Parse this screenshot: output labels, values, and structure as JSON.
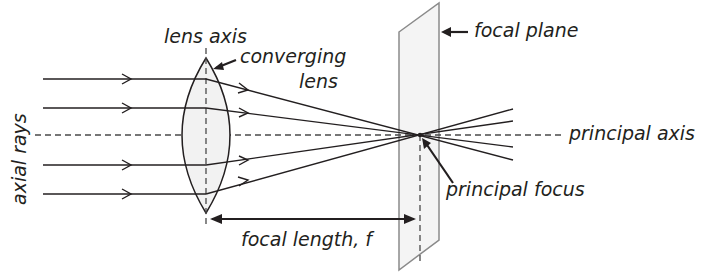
{
  "diagram": {
    "colors": {
      "line": "#231f20",
      "lens_fill": "#f2f2f2",
      "plane_fill": "#f4f4f4",
      "plane_stroke": "#8a8a8a",
      "dash": "#4a4a4a"
    },
    "labels": {
      "lens_axis": "lens axis",
      "converging_lens_line1": "converging",
      "converging_lens_line2": "lens",
      "axial_rays": "axial rays",
      "focal_plane": "focal plane",
      "principal_axis": "principal axis",
      "principal_focus": "principal focus",
      "focal_length": "focal length, f"
    },
    "elements": {
      "principal_axis_y": 135,
      "lens_center_x": 206,
      "lens_top_y": 58,
      "lens_bottom_y": 213,
      "focal_point": [
        420,
        135
      ],
      "incoming_ray_ys": [
        79,
        108,
        165,
        194
      ],
      "ray_count": 4,
      "focal_plane_corners": [
        [
          399,
          32
        ],
        [
          439,
          3
        ],
        [
          439,
          240
        ],
        [
          399,
          270
        ]
      ]
    }
  }
}
